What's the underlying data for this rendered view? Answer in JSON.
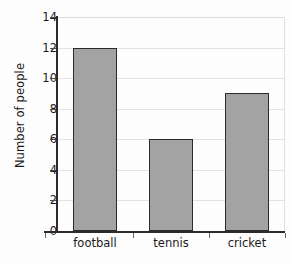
{
  "chart_data": {
    "type": "bar",
    "title": "",
    "xlabel": "",
    "ylabel": "Number of people",
    "categories": [
      "football",
      "tennis",
      "cricket"
    ],
    "values": [
      12,
      6,
      9
    ],
    "ylim": [
      0,
      14
    ],
    "ytick_values": [
      0,
      2,
      4,
      6,
      8,
      10,
      12,
      14
    ],
    "ytick_labels": [
      "0",
      "2",
      "4",
      "6",
      "8",
      "10",
      "12",
      "14"
    ],
    "grid": true,
    "grid_axis": "y",
    "legend": false,
    "bar_fill_color": "#a3a3a3",
    "bar_border_color": "#2b2b2b",
    "axis_color": "#2b2b2b",
    "gridline_color": "#e3e3e3",
    "background_color": "#fdfdfd"
  }
}
